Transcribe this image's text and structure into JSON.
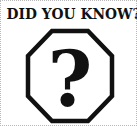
{
  "title": "DID YOU KNOW?",
  "icon": {
    "name": "question-mark-octagon-icon",
    "glyph": "?",
    "stroke_color": "#111111",
    "fill_color": "#ffffff"
  },
  "colors": {
    "background": "#ffffff",
    "text": "#111111",
    "border": "#b8b8b8"
  }
}
